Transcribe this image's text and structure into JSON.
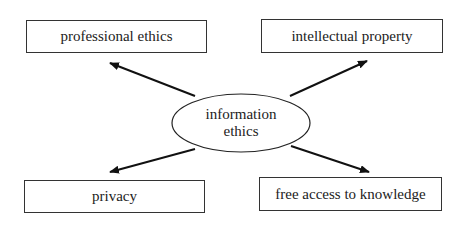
{
  "diagram": {
    "center": {
      "line1": "information",
      "line2": "ethics"
    },
    "nodes": [
      {
        "id": "professional-ethics",
        "label": "professional ethics"
      },
      {
        "id": "intellectual-property",
        "label": "intellectual property"
      },
      {
        "id": "privacy",
        "label": "privacy"
      },
      {
        "id": "free-access",
        "label": "free access to knowledge"
      }
    ],
    "edges": [
      {
        "from": "information ethics",
        "to": "professional ethics"
      },
      {
        "from": "information ethics",
        "to": "intellectual property"
      },
      {
        "from": "information ethics",
        "to": "privacy"
      },
      {
        "from": "information ethics",
        "to": "free access to knowledge"
      }
    ]
  }
}
